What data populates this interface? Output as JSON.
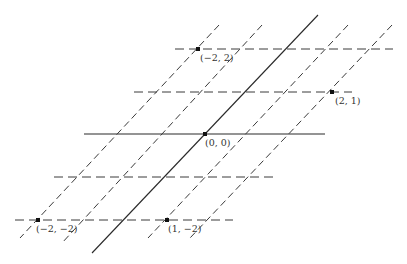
{
  "diagram": {
    "title": "",
    "colors": {
      "line": "#2a2a2a",
      "point": "#111111",
      "label": "#333333",
      "background": "#ffffff"
    },
    "horizontal_lines": [
      {
        "id": "row-2",
        "x1": 175,
        "x2": 393,
        "y": 49,
        "style": "dashed"
      },
      {
        "id": "row-1",
        "x1": 134,
        "x2": 352,
        "y": 92,
        "style": "dashed"
      },
      {
        "id": "row-0",
        "x1": 84,
        "x2": 325,
        "y": 134,
        "style": "solid"
      },
      {
        "id": "row-m1",
        "x1": 54,
        "x2": 274,
        "y": 177,
        "style": "dashed"
      },
      {
        "id": "row-m2",
        "x1": 15,
        "x2": 233,
        "y": 220,
        "style": "dashed"
      }
    ],
    "slanted_lines": [
      {
        "id": "col-m2",
        "x1": 219,
        "y1": 25,
        "x2": 20,
        "y2": 238,
        "style": "dashed"
      },
      {
        "id": "col-m1",
        "x1": 262,
        "y1": 25,
        "x2": 62,
        "y2": 243,
        "style": "dashed"
      },
      {
        "id": "col-0",
        "x1": 318,
        "y1": 15,
        "x2": 92,
        "y2": 253,
        "style": "solid"
      },
      {
        "id": "col-1",
        "x1": 348,
        "y1": 25,
        "x2": 148,
        "y2": 238,
        "style": "dashed"
      },
      {
        "id": "col-2",
        "x1": 392,
        "y1": 25,
        "x2": 190,
        "y2": 238,
        "style": "dashed"
      }
    ],
    "points": [
      {
        "label": "(−2, 2)",
        "x": 198,
        "y": 49,
        "lx": 200,
        "ly": 61
      },
      {
        "label": "(2, 1)",
        "x": 332,
        "y": 92,
        "lx": 335,
        "ly": 104
      },
      {
        "label": "(0, 0)",
        "x": 205,
        "y": 134,
        "lx": 205,
        "ly": 146
      },
      {
        "label": "(−2, −2)",
        "x": 38,
        "y": 220,
        "lx": 36,
        "ly": 232
      },
      {
        "label": "(1, −2)",
        "x": 167,
        "y": 220,
        "lx": 168,
        "ly": 232
      }
    ]
  }
}
